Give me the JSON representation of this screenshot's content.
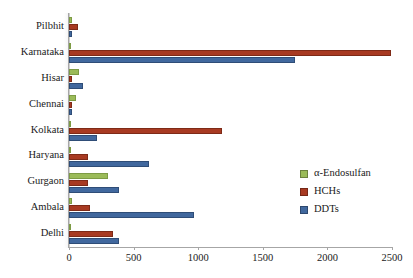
{
  "chart_data": {
    "type": "bar",
    "orientation": "horizontal",
    "title": "",
    "xlabel": "",
    "ylabel": "",
    "xlim": [
      0,
      2500
    ],
    "xticks": [
      0,
      500,
      1000,
      1500,
      2000,
      2500
    ],
    "xtick_labels": [
      "0",
      "500",
      "1000",
      "1500",
      "2000",
      "2500"
    ],
    "grid": false,
    "legend_position": "right-middle",
    "categories": [
      "Pilbhit",
      "Karnataka",
      "Hisar",
      "Chennai",
      "Kolkata",
      "Haryana",
      "Gurgaon",
      "Ambala",
      "Delhi"
    ],
    "series": [
      {
        "name": "α-Endosulfan",
        "color": "#9BBB59",
        "values": [
          20,
          10,
          75,
          55,
          10,
          10,
          300,
          20,
          10
        ]
      },
      {
        "name": "HCHs",
        "color": "#A83A22",
        "values": [
          70,
          2490,
          25,
          25,
          1185,
          150,
          150,
          165,
          340
        ]
      },
      {
        "name": "DDTs",
        "color": "#41689E",
        "values": [
          25,
          1750,
          105,
          25,
          215,
          620,
          385,
          970,
          385
        ]
      }
    ]
  },
  "legend": {
    "items": [
      {
        "label": "α-Endosulfan",
        "key": "endo"
      },
      {
        "label": "HCHs",
        "key": "hch"
      },
      {
        "label": "DDTs",
        "key": "ddt"
      }
    ]
  }
}
